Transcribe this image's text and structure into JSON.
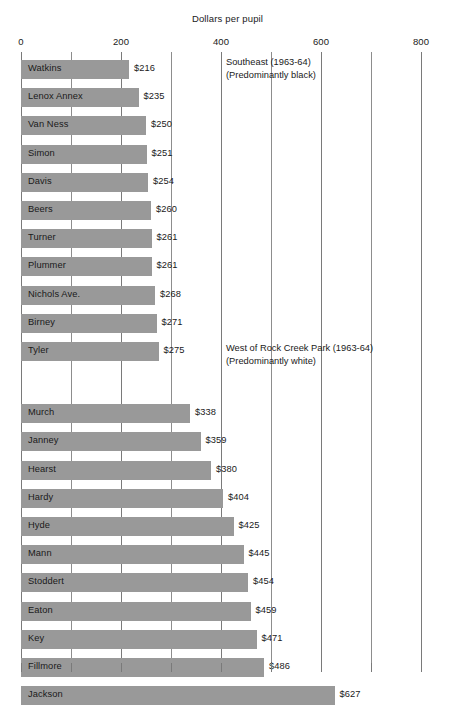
{
  "chart_data": {
    "type": "bar",
    "orientation": "horizontal",
    "title": "Dollars per pupil",
    "xlabel": "",
    "ylabel": "",
    "xlim": [
      0,
      800
    ],
    "xticks": [
      0,
      200,
      400,
      600,
      800
    ],
    "xtick_labels": [
      "0",
      "200",
      "400",
      "600",
      "800"
    ],
    "grid": true,
    "legend": "none",
    "categories": [
      "Watkins",
      "Lenox Annex",
      "Van Ness",
      "Simon",
      "Davis",
      "Beers",
      "Turner",
      "Plummer",
      "Nichols Ave.",
      "Birney",
      "Tyler",
      "Murch",
      "Janney",
      "Hearst",
      "Hardy",
      "Hyde",
      "Mann",
      "Stoddert",
      "Eaton",
      "Key",
      "Fillmore",
      "Jackson"
    ],
    "values": [
      216,
      235,
      250,
      251,
      254,
      260,
      261,
      261,
      268,
      271,
      275,
      338,
      359,
      380,
      404,
      425,
      445,
      454,
      459,
      471,
      486,
      627
    ],
    "value_labels": [
      "$216",
      "$235",
      "$250",
      "$251",
      "$254",
      "$260",
      "$261",
      "$261",
      "$268",
      "$271",
      "$275",
      "$338",
      "$359",
      "$380",
      "$404",
      "$425",
      "$445",
      "$454",
      "$459",
      "$471",
      "$486",
      "$627"
    ],
    "bar_color": "#999999",
    "groups": [
      {
        "name": "Southeast (1963-64)",
        "subtitle": "(Predominantly black)",
        "start_index": 0,
        "end_index": 10
      },
      {
        "name": "West of Rock Creek Park (1963-64)",
        "subtitle": "(Predominantly white)",
        "start_index": 11,
        "end_index": 21
      }
    ],
    "annotations": [
      {
        "line1": "Southeast (1963-64)",
        "line2": "(Predominantly black)"
      },
      {
        "line1": "West of Rock Creek Park (1963-64)",
        "line2": "(Predominantly white)"
      }
    ]
  },
  "source_note": ""
}
